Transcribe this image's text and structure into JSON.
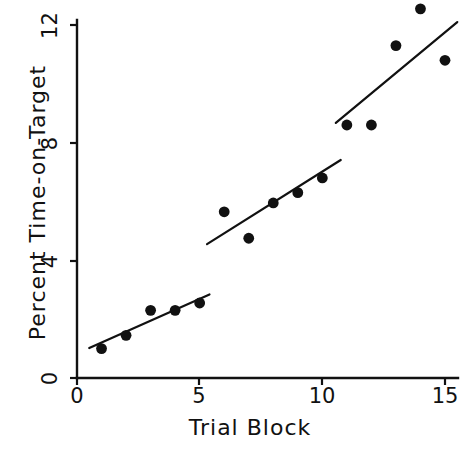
{
  "chart_data": {
    "type": "scatter",
    "title": "",
    "xlabel": "Trial Block",
    "ylabel": "Percent Time-on-Target",
    "xlim": [
      0,
      15.6
    ],
    "ylim": [
      0,
      12.4
    ],
    "xticks": [
      0,
      5,
      10,
      15
    ],
    "xtick_labels": [
      "0",
      "5",
      "10",
      "15"
    ],
    "yticks": [
      0,
      4,
      8,
      12
    ],
    "ytick_labels": [
      "0",
      "4",
      "8",
      "12"
    ],
    "grid": false,
    "legend": "none",
    "marker": "filled-circle",
    "marker_color": "#111111",
    "line_color": "#111111",
    "x": [
      1,
      2,
      3,
      4,
      5,
      6,
      7,
      8,
      9,
      10,
      11,
      12,
      13,
      14,
      15
    ],
    "y": [
      1.0,
      1.45,
      2.3,
      2.3,
      2.55,
      5.65,
      4.75,
      5.95,
      6.3,
      6.8,
      8.6,
      8.6,
      11.3,
      12.55,
      10.8
    ],
    "series": [
      {
        "name": "Phase 1 observations",
        "points": [
          {
            "x": 1,
            "y": 1.0
          },
          {
            "x": 2,
            "y": 1.45
          },
          {
            "x": 3,
            "y": 2.3
          },
          {
            "x": 4,
            "y": 2.3
          },
          {
            "x": 5,
            "y": 2.55
          }
        ]
      },
      {
        "name": "Phase 2 observations",
        "points": [
          {
            "x": 6,
            "y": 5.65
          },
          {
            "x": 7,
            "y": 4.75
          },
          {
            "x": 8,
            "y": 5.95
          },
          {
            "x": 9,
            "y": 6.3
          },
          {
            "x": 10,
            "y": 6.8
          }
        ]
      },
      {
        "name": "Phase 3 observations",
        "points": [
          {
            "x": 11,
            "y": 8.6
          },
          {
            "x": 12,
            "y": 8.6
          },
          {
            "x": 13,
            "y": 11.3
          },
          {
            "x": 14,
            "y": 12.55
          },
          {
            "x": 15,
            "y": 10.8
          }
        ]
      }
    ],
    "fit_lines": [
      {
        "name": "Phase 1 regression",
        "x0": 0.5,
        "y0": 1.02,
        "x1": 5.4,
        "y1": 2.84
      },
      {
        "name": "Phase 2 regression",
        "x0": 5.3,
        "y0": 4.55,
        "x1": 10.75,
        "y1": 7.41
      },
      {
        "name": "Phase 3 regression",
        "x0": 10.55,
        "y0": 8.67,
        "x1": 15.5,
        "y1": 12.1
      }
    ]
  },
  "axes": {
    "x_title": "Trial Block",
    "y_title": "Percent Time-on-Target",
    "x_tick_0": "0",
    "x_tick_1": "5",
    "x_tick_2": "10",
    "x_tick_3": "15",
    "y_tick_0": "0",
    "y_tick_1": "4",
    "y_tick_2": "8",
    "y_tick_3": "12"
  }
}
